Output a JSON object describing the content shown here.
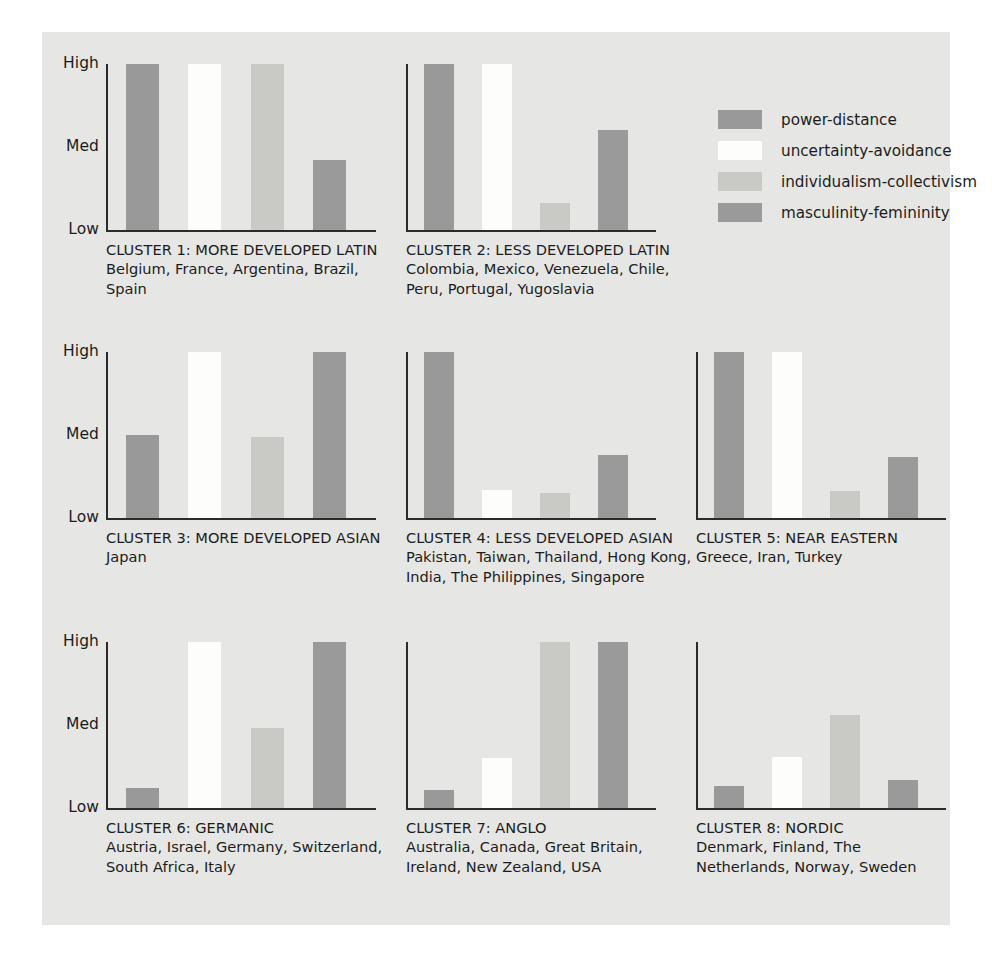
{
  "legend": {
    "items": [
      {
        "label": "power-distance",
        "color": "#999999"
      },
      {
        "label": "uncertainty-avoidance",
        "color": "#fdfdfb"
      },
      {
        "label": "individualism-collectivism",
        "color": "#c9c9c5"
      },
      {
        "label": "masculinity-femininity",
        "color": "#9a9a9a"
      }
    ]
  },
  "axis": {
    "ticks": [
      "High",
      "Med",
      "Low"
    ]
  },
  "chart_data": {
    "type": "bar",
    "xlabel": "",
    "ylabel": "",
    "ylim": [
      0,
      1
    ],
    "ytick_labels": [
      "Low",
      "Med",
      "High"
    ],
    "ytick_values": [
      0,
      0.5,
      1
    ],
    "grid": false,
    "legend_position": "top-right",
    "series": [
      {
        "name": "power-distance",
        "color": "#999999"
      },
      {
        "name": "uncertainty-avoidance",
        "color": "#fdfdfb"
      },
      {
        "name": "individualism-collectivism",
        "color": "#c9c9c5"
      },
      {
        "name": "masculinity-femininity",
        "color": "#9a9a9a"
      }
    ],
    "categories": [
      "CLUSTER 1: MORE DEVELOPED LATIN",
      "CLUSTER 2: LESS DEVELOPED LATIN",
      "CLUSTER 3: MORE DEVELOPED ASIAN",
      "CLUSTER 4: LESS DEVELOPED ASIAN",
      "CLUSTER 5: NEAR EASTERN",
      "CLUSTER 6: GERMANIC",
      "CLUSTER 7: ANGLO",
      "CLUSTER 8: NORDIC"
    ],
    "values": [
      [
        1.0,
        1.0,
        1.0,
        0.42
      ],
      [
        1.0,
        1.0,
        0.16,
        0.6
      ],
      [
        0.5,
        1.0,
        0.49,
        1.0
      ],
      [
        1.0,
        0.17,
        0.15,
        0.38
      ],
      [
        1.0,
        1.0,
        0.16,
        0.37
      ],
      [
        0.12,
        1.0,
        0.48,
        1.0
      ],
      [
        0.11,
        0.3,
        1.0,
        1.0
      ],
      [
        0.13,
        0.31,
        0.56,
        0.17
      ]
    ]
  },
  "clusters": [
    {
      "id": "cluster-1",
      "title": "CLUSTER 1: MORE DEVELOPED LATIN",
      "members": "Belgium, France, Argentina, Brazil,\nSpain",
      "members_lines": [
        "Belgium, France, Argentina, Brazil,",
        "Spain"
      ],
      "values": [
        1.0,
        1.0,
        1.0,
        0.42
      ]
    },
    {
      "id": "cluster-2",
      "title": "CLUSTER 2: LESS DEVELOPED LATIN",
      "members": "Colombia, Mexico, Venezuela, Chile,\nPeru, Portugal, Yugoslavia",
      "members_lines": [
        "Colombia, Mexico, Venezuela, Chile,",
        "Peru, Portugal, Yugoslavia"
      ],
      "values": [
        1.0,
        1.0,
        0.16,
        0.6
      ]
    },
    {
      "id": "cluster-3",
      "title": "CLUSTER 3: MORE DEVELOPED ASIAN",
      "members": "Japan",
      "members_lines": [
        "Japan"
      ],
      "values": [
        0.5,
        1.0,
        0.49,
        1.0
      ]
    },
    {
      "id": "cluster-4",
      "title": "CLUSTER 4: LESS DEVELOPED ASIAN",
      "members": "Pakistan, Taiwan, Thailand, Hong Kong,\nIndia, The Philippines, Singapore",
      "members_lines": [
        "Pakistan, Taiwan, Thailand, Hong Kong,",
        "India, The Philippines, Singapore"
      ],
      "values": [
        1.0,
        0.17,
        0.15,
        0.38
      ]
    },
    {
      "id": "cluster-5",
      "title": "CLUSTER 5: NEAR EASTERN",
      "members": "Greece, Iran, Turkey",
      "members_lines": [
        "Greece, Iran, Turkey"
      ],
      "values": [
        1.0,
        1.0,
        0.16,
        0.37
      ]
    },
    {
      "id": "cluster-6",
      "title": "CLUSTER 6: GERMANIC",
      "members": "Austria, Israel, Germany, Switzerland,\nSouth Africa, Italy",
      "members_lines": [
        "Austria, Israel, Germany, Switzerland,",
        "South Africa, Italy"
      ],
      "values": [
        0.12,
        1.0,
        0.48,
        1.0
      ]
    },
    {
      "id": "cluster-7",
      "title": "CLUSTER 7: ANGLO",
      "members": "Australia, Canada, Great Britain,\nIreland, New Zealand, USA",
      "members_lines": [
        "Australia, Canada, Great Britain,",
        "Ireland, New Zealand, USA"
      ],
      "values": [
        0.11,
        0.3,
        1.0,
        1.0
      ]
    },
    {
      "id": "cluster-8",
      "title": "CLUSTER 8: NORDIC",
      "members": "Denmark, Finland, The\nNetherlands, Norway, Sweden",
      "members_lines": [
        "Denmark, Finland, The",
        "Netherlands, Norway, Sweden"
      ],
      "values": [
        0.13,
        0.31,
        0.56,
        0.17
      ]
    }
  ],
  "colors": {
    "panel_background": "#e6e6e4",
    "page_background": "#ffffff",
    "axis": "#2b2b2b",
    "text": "#1c1c1c"
  }
}
